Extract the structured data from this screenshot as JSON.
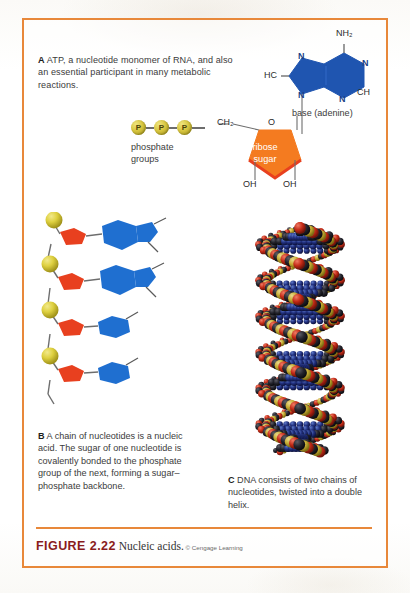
{
  "figure": {
    "number_label": "FIGURE 2.22",
    "title": "Nucleic acids.",
    "credit": "© Cengage Learning",
    "border_color": "#e8883a",
    "rule_color": "#e8883a"
  },
  "panel_a": {
    "letter": "A",
    "caption": " ATP, a nucleotide monomer of RNA, and also an essential participant in many metabolic reactions.",
    "phosphate": {
      "circle_label": "P",
      "count": 3,
      "label_line1": "phosphate",
      "label_line2": "groups",
      "color": "#d8c63f"
    },
    "ribose": {
      "label_line1": "ribose",
      "label_line2": "sugar",
      "color": "#f47b20",
      "bonds": {
        "ch2": "CH₂",
        "ring_oxygen": "O",
        "hydroxyl_left": "OH",
        "hydroxyl_right": "OH"
      }
    },
    "base": {
      "label": "base (adenine)",
      "color": "#1f55b0",
      "atoms": {
        "amine": "NH₂",
        "n_top_right": "N",
        "n_bottom_right": "N",
        "ch_right": "CH",
        "n_top_left": "N",
        "n_bottom_left": "N",
        "hc_left": "HC"
      }
    }
  },
  "panel_b": {
    "letter": "B",
    "caption": " A chain of nucleotides is a nucleic acid. The sugar of one nucleotide is covalently bonded to the phosphate group of the next, forming a sugar–phosphate backbone.",
    "chain": {
      "unit_count": 4,
      "phosphate_color": "#d8c63f",
      "sugar_color": "#e8401f",
      "base_color": "#1f6fd0",
      "bond_color": "#6d6d6d"
    }
  },
  "panel_c": {
    "letter": "C",
    "caption": " DNA consists of two chains of nucleotides, twisted into a double helix.",
    "model": {
      "type": "space-filling double helix",
      "atom_colors": [
        "#b81f12",
        "#1d1d24",
        "#1f2f7a",
        "#c9b23a",
        "#e8e4d8"
      ]
    }
  }
}
